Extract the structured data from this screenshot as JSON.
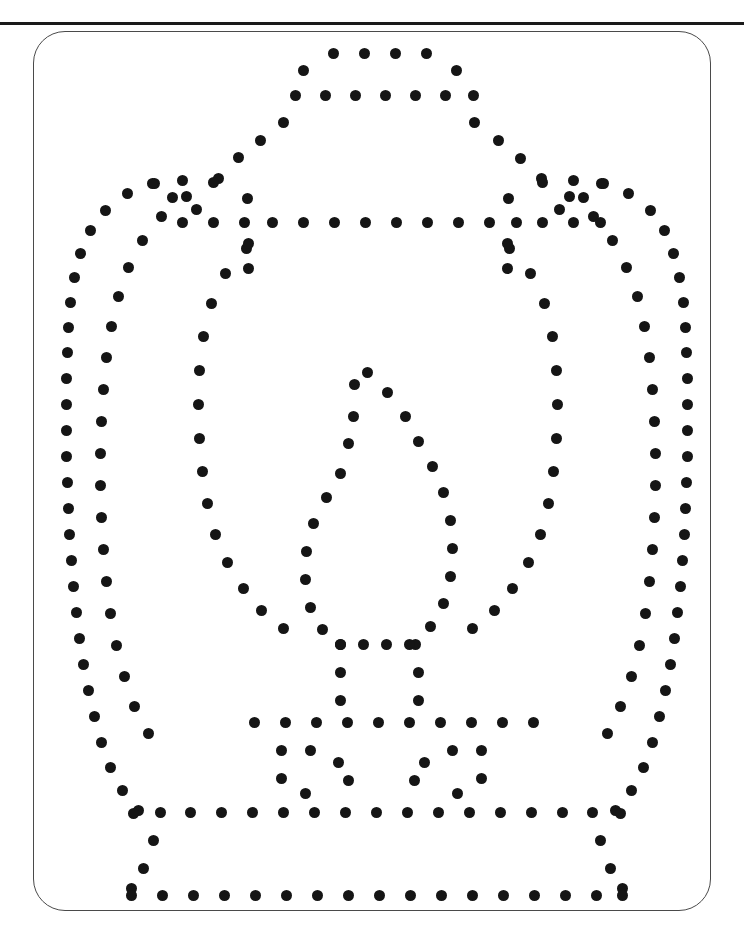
{
  "page": {
    "width": 744,
    "height": 927,
    "background_color": "#ffffff"
  },
  "top_rule": {
    "name": "top-horizontal-rule",
    "color": "#1a1a1a",
    "thickness": 3,
    "y": 22
  },
  "card_frame": {
    "name": "rounded-card-border",
    "x": 33,
    "y": 31,
    "width": 678,
    "height": 880,
    "corner_radius": 32,
    "stroke_color": "#4a4a4a",
    "stroke_width": 1
  },
  "artwork": {
    "subject": "lantern",
    "style": "dotted-outline",
    "dot_color": "#151515",
    "dot_diameter": 11,
    "total_dots": 312,
    "description": "A lantern rendered entirely as punch dots: domed top, outer shell wall, inner shell wall, inner oval chamber, central teardrop flame, and a flared stepped base."
  },
  "dot_groups": [
    {
      "name": "top-dome-crown-row",
      "points": [
        [
          333,
          53
        ],
        [
          364,
          53
        ],
        [
          395,
          53
        ],
        [
          426,
          53
        ],
        [
          303,
          70
        ],
        [
          456,
          70
        ]
      ]
    },
    {
      "name": "top-dome-brim-row",
      "points": [
        [
          295,
          95
        ],
        [
          325,
          95
        ],
        [
          355,
          95
        ],
        [
          385,
          95
        ],
        [
          415,
          95
        ],
        [
          445,
          95
        ],
        [
          473,
          95
        ]
      ]
    },
    {
      "name": "dome-left-shoulder",
      "points": [
        [
          283,
          122
        ],
        [
          260,
          140
        ],
        [
          238,
          157
        ],
        [
          218,
          178
        ]
      ]
    },
    {
      "name": "dome-right-shoulder",
      "points": [
        [
          474,
          122
        ],
        [
          498,
          140
        ],
        [
          520,
          158
        ],
        [
          541,
          178
        ]
      ]
    },
    {
      "name": "outer-shell-left",
      "points": [
        [
          182,
          180
        ],
        [
          154,
          183
        ],
        [
          127,
          193
        ],
        [
          105,
          210
        ],
        [
          90,
          230
        ],
        [
          80,
          253
        ],
        [
          74,
          277
        ],
        [
          70,
          302
        ],
        [
          68,
          327
        ],
        [
          67,
          352
        ],
        [
          66,
          378
        ],
        [
          66,
          404
        ],
        [
          66,
          430
        ],
        [
          66,
          456
        ],
        [
          67,
          482
        ],
        [
          68,
          508
        ],
        [
          69,
          534
        ],
        [
          71,
          560
        ],
        [
          73,
          586
        ],
        [
          76,
          612
        ],
        [
          79,
          638
        ],
        [
          83,
          664
        ],
        [
          88,
          690
        ],
        [
          94,
          716
        ],
        [
          101,
          742
        ],
        [
          110,
          767
        ],
        [
          122,
          790
        ],
        [
          138,
          810
        ]
      ]
    },
    {
      "name": "outer-shell-right",
      "points": [
        [
          573,
          180
        ],
        [
          601,
          183
        ],
        [
          628,
          193
        ],
        [
          650,
          210
        ],
        [
          664,
          230
        ],
        [
          673,
          253
        ],
        [
          679,
          277
        ],
        [
          683,
          302
        ],
        [
          685,
          327
        ],
        [
          686,
          352
        ],
        [
          687,
          378
        ],
        [
          687,
          404
        ],
        [
          687,
          430
        ],
        [
          687,
          456
        ],
        [
          686,
          482
        ],
        [
          685,
          508
        ],
        [
          684,
          534
        ],
        [
          682,
          560
        ],
        [
          680,
          586
        ],
        [
          677,
          612
        ],
        [
          674,
          638
        ],
        [
          670,
          664
        ],
        [
          665,
          690
        ],
        [
          659,
          716
        ],
        [
          652,
          742
        ],
        [
          643,
          767
        ],
        [
          631,
          790
        ],
        [
          615,
          810
        ]
      ]
    },
    {
      "name": "inner-shell-left",
      "points": [
        [
          213,
          182
        ],
        [
          186,
          196
        ],
        [
          161,
          216
        ],
        [
          142,
          240
        ],
        [
          128,
          267
        ],
        [
          118,
          296
        ],
        [
          111,
          326
        ],
        [
          106,
          357
        ],
        [
          103,
          389
        ],
        [
          101,
          421
        ],
        [
          100,
          453
        ],
        [
          100,
          485
        ],
        [
          101,
          517
        ],
        [
          103,
          549
        ],
        [
          106,
          581
        ],
        [
          110,
          613
        ],
        [
          116,
          645
        ],
        [
          124,
          676
        ],
        [
          134,
          706
        ],
        [
          148,
          733
        ]
      ]
    },
    {
      "name": "inner-shell-right",
      "points": [
        [
          542,
          182
        ],
        [
          569,
          196
        ],
        [
          593,
          216
        ],
        [
          612,
          240
        ],
        [
          626,
          267
        ],
        [
          637,
          296
        ],
        [
          644,
          326
        ],
        [
          649,
          357
        ],
        [
          652,
          389
        ],
        [
          654,
          421
        ],
        [
          655,
          453
        ],
        [
          655,
          485
        ],
        [
          654,
          517
        ],
        [
          652,
          549
        ],
        [
          649,
          581
        ],
        [
          645,
          613
        ],
        [
          639,
          645
        ],
        [
          631,
          676
        ],
        [
          620,
          706
        ],
        [
          607,
          733
        ]
      ]
    },
    {
      "name": "upper-crossbar-row",
      "points": [
        [
          182,
          222
        ],
        [
          213,
          222
        ],
        [
          244,
          222
        ],
        [
          272,
          222
        ],
        [
          303,
          222
        ],
        [
          334,
          222
        ],
        [
          365,
          222
        ],
        [
          396,
          222
        ],
        [
          427,
          222
        ],
        [
          458,
          222
        ],
        [
          489,
          222
        ],
        [
          516,
          222
        ],
        [
          542,
          222
        ],
        [
          573,
          222
        ],
        [
          600,
          222
        ]
      ]
    },
    {
      "name": "inner-chamber-left",
      "points": [
        [
          246,
          248
        ],
        [
          225,
          273
        ],
        [
          211,
          303
        ],
        [
          203,
          336
        ],
        [
          199,
          370
        ],
        [
          198,
          404
        ],
        [
          199,
          438
        ],
        [
          202,
          471
        ],
        [
          207,
          503
        ],
        [
          215,
          534
        ],
        [
          227,
          562
        ],
        [
          243,
          588
        ],
        [
          261,
          610
        ],
        [
          283,
          628
        ]
      ]
    },
    {
      "name": "inner-chamber-right",
      "points": [
        [
          509,
          248
        ],
        [
          530,
          273
        ],
        [
          544,
          303
        ],
        [
          552,
          336
        ],
        [
          556,
          370
        ],
        [
          557,
          404
        ],
        [
          556,
          438
        ],
        [
          553,
          471
        ],
        [
          548,
          503
        ],
        [
          540,
          534
        ],
        [
          528,
          562
        ],
        [
          512,
          588
        ],
        [
          494,
          610
        ],
        [
          472,
          628
        ]
      ]
    },
    {
      "name": "flame-apex",
      "points": [
        [
          367,
          372
        ],
        [
          354,
          384
        ],
        [
          387,
          392
        ]
      ]
    },
    {
      "name": "flame-left-curve",
      "points": [
        [
          353,
          416
        ],
        [
          348,
          443
        ],
        [
          340,
          473
        ],
        [
          326,
          497
        ],
        [
          313,
          523
        ],
        [
          306,
          551
        ],
        [
          305,
          579
        ],
        [
          310,
          607
        ],
        [
          322,
          629
        ],
        [
          340,
          644
        ]
      ]
    },
    {
      "name": "flame-right-curve",
      "points": [
        [
          405,
          416
        ],
        [
          418,
          441
        ],
        [
          432,
          466
        ],
        [
          443,
          492
        ],
        [
          450,
          520
        ],
        [
          452,
          548
        ],
        [
          450,
          576
        ],
        [
          443,
          603
        ],
        [
          430,
          626
        ],
        [
          415,
          644
        ]
      ]
    },
    {
      "name": "flame-base-row",
      "points": [
        [
          340,
          644
        ],
        [
          363,
          644
        ],
        [
          386,
          644
        ],
        [
          409,
          644
        ]
      ]
    },
    {
      "name": "flame-stem-left",
      "points": [
        [
          340,
          672
        ],
        [
          340,
          700
        ]
      ]
    },
    {
      "name": "flame-stem-right",
      "points": [
        [
          418,
          672
        ],
        [
          418,
          700
        ]
      ]
    },
    {
      "name": "lower-crossbar-row",
      "points": [
        [
          254,
          722
        ],
        [
          285,
          722
        ],
        [
          316,
          722
        ],
        [
          347,
          722
        ],
        [
          378,
          722
        ],
        [
          409,
          722
        ],
        [
          440,
          722
        ],
        [
          471,
          722
        ],
        [
          502,
          722
        ],
        [
          533,
          722
        ]
      ]
    },
    {
      "name": "base-left-notch",
      "points": [
        [
          281,
          750
        ],
        [
          281,
          778
        ]
      ]
    },
    {
      "name": "base-right-notch",
      "points": [
        [
          481,
          750
        ],
        [
          481,
          778
        ]
      ]
    },
    {
      "name": "base-shelf-row",
      "points": [
        [
          190,
          812
        ],
        [
          221,
          812
        ],
        [
          252,
          812
        ],
        [
          283,
          812
        ],
        [
          314,
          812
        ],
        [
          345,
          812
        ],
        [
          376,
          812
        ],
        [
          407,
          812
        ],
        [
          438,
          812
        ],
        [
          469,
          812
        ],
        [
          500,
          812
        ],
        [
          531,
          812
        ],
        [
          562,
          812
        ]
      ]
    },
    {
      "name": "base-left-flare",
      "points": [
        [
          160,
          812
        ],
        [
          133,
          813
        ],
        [
          153,
          840
        ],
        [
          143,
          868
        ],
        [
          131,
          888
        ]
      ]
    },
    {
      "name": "base-right-flare",
      "points": [
        [
          592,
          812
        ],
        [
          620,
          813
        ],
        [
          600,
          840
        ],
        [
          610,
          868
        ],
        [
          622,
          888
        ]
      ]
    },
    {
      "name": "base-foot-row",
      "points": [
        [
          131,
          895
        ],
        [
          162,
          895
        ],
        [
          193,
          895
        ],
        [
          224,
          895
        ],
        [
          255,
          895
        ],
        [
          286,
          895
        ],
        [
          317,
          895
        ],
        [
          348,
          895
        ],
        [
          379,
          895
        ],
        [
          410,
          895
        ],
        [
          441,
          895
        ],
        [
          472,
          895
        ],
        [
          503,
          895
        ],
        [
          534,
          895
        ],
        [
          565,
          895
        ],
        [
          596,
          895
        ],
        [
          622,
          895
        ]
      ]
    },
    {
      "name": "shoulder-left-cluster",
      "points": [
        [
          152,
          183
        ],
        [
          172,
          197
        ],
        [
          196,
          209
        ],
        [
          247,
          198
        ],
        [
          248,
          243
        ],
        [
          248,
          268
        ]
      ]
    },
    {
      "name": "shoulder-right-cluster",
      "points": [
        [
          603,
          183
        ],
        [
          583,
          197
        ],
        [
          559,
          209
        ],
        [
          508,
          198
        ],
        [
          507,
          243
        ],
        [
          507,
          268
        ]
      ]
    },
    {
      "name": "base-inner-left-step",
      "points": [
        [
          310,
          750
        ],
        [
          338,
          762
        ],
        [
          348,
          780
        ],
        [
          305,
          793
        ]
      ]
    },
    {
      "name": "base-inner-right-step",
      "points": [
        [
          452,
          750
        ],
        [
          424,
          762
        ],
        [
          414,
          780
        ],
        [
          457,
          793
        ]
      ]
    }
  ]
}
